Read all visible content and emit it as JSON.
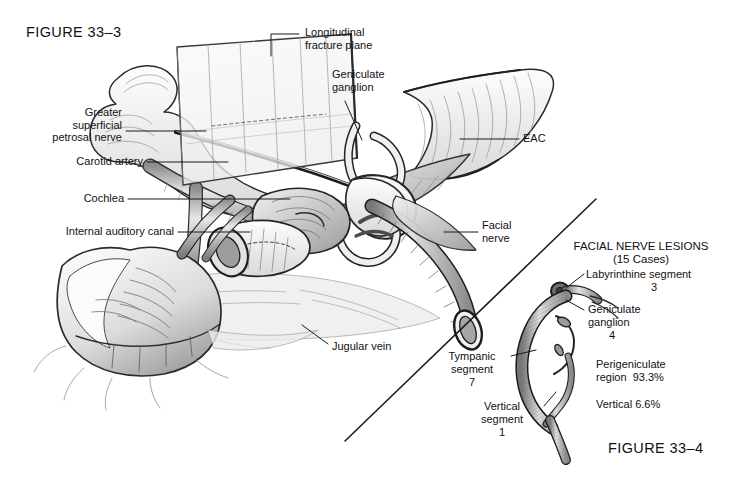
{
  "figure_left": {
    "title": "FIGURE 33–3"
  },
  "figure_right": {
    "title": "FIGURE 33–4"
  },
  "labels_main": [
    {
      "id": "longitudinal-fracture-plane",
      "text": "Longitudinal\nfracture plane"
    },
    {
      "id": "geniculate-ganglion",
      "text": "Geniculate\nganglion"
    },
    {
      "id": "greater-superficial-petrosal-nerve",
      "text": "Greater\nsuperficial\npetrosal nerve"
    },
    {
      "id": "carotid-artery",
      "text": "Carotid artery"
    },
    {
      "id": "cochlea",
      "text": "Cochlea"
    },
    {
      "id": "internal-auditory-canal",
      "text": "Internal auditory canal"
    },
    {
      "id": "eac",
      "text": "EAC"
    },
    {
      "id": "facial-nerve",
      "text": "Facial\nnerve"
    },
    {
      "id": "jugular-vein",
      "text": "Jugular vein"
    }
  ],
  "inset": {
    "heading": "FACIAL NERVE LESIONS",
    "subheading": "(15 Cases)",
    "labels": [
      {
        "id": "labyrinthine-segment",
        "name": "Labyrinthine segment",
        "count": "3"
      },
      {
        "id": "geniculate-ganglion",
        "name": "Geniculate\nganglion",
        "count": "4"
      },
      {
        "id": "tympanic-segment",
        "name": "Tympanic\nsegment",
        "count": "7"
      },
      {
        "id": "vertical-segment",
        "name": "Vertical\nsegment",
        "count": "1"
      }
    ],
    "stats": [
      {
        "id": "perigeniculate-region",
        "text": "Perigeniculate\nregion  93.3%"
      },
      {
        "id": "vertical",
        "text": "Vertical 6.6%"
      }
    ]
  },
  "colors": {
    "ink": "#141414",
    "paper": "#ffffff",
    "graphite_light": "#d8d8d8",
    "graphite_mid": "#a8a8a8",
    "graphite_dark": "#6e6e6e"
  }
}
